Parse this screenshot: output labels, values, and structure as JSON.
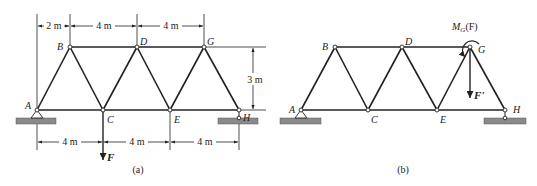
{
  "figure_a": {
    "caption": "(a)",
    "nodes": {
      "A": "A",
      "B": "B",
      "C": "C",
      "D": "D",
      "E": "E",
      "G": "G",
      "H": "H"
    },
    "top_dims": [
      "2 m",
      "4 m",
      "4 m"
    ],
    "height_dim": "3 m",
    "bottom_dims": [
      "4 m",
      "4 m",
      "4 m"
    ],
    "force_label": "F"
  },
  "figure_b": {
    "caption": "(b)",
    "nodes": {
      "A": "A",
      "B": "B",
      "C": "C",
      "D": "D",
      "E": "E",
      "G": "G",
      "H": "H"
    },
    "moment_label_main": "M",
    "moment_label_sub": "G",
    "moment_label_arg": "(F)",
    "force_label": "F'"
  }
}
